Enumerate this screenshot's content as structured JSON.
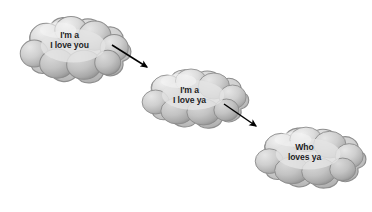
{
  "canvas": {
    "width": 372,
    "height": 212,
    "background": "#ffffff"
  },
  "palette": {
    "cloud_light": "#e9e9e9",
    "cloud_mid": "#c9c9c9",
    "cloud_shadow": "#a6a6a6",
    "cloud_edge": "#8f8f8f",
    "text": "#1d1d1f",
    "arrow": "#000000"
  },
  "diagram": {
    "type": "flow",
    "title": "",
    "nodes": [
      {
        "id": "cloud-1",
        "shape": "cloud",
        "line1": "I'm a",
        "line2": "I love you",
        "label_x": 69,
        "label_y": 33,
        "box": {
          "x": 17,
          "y": 11,
          "w": 105,
          "h": 76
        }
      },
      {
        "id": "cloud-2",
        "shape": "cloud",
        "line1": "I'm a",
        "line2": "I love ya",
        "label_x": 190,
        "label_y": 87,
        "box": {
          "x": 139,
          "y": 64,
          "w": 101,
          "h": 68
        }
      },
      {
        "id": "cloud-3",
        "shape": "cloud",
        "line1": "Who",
        "line2": "loves ya",
        "label_x": 306,
        "label_y": 144,
        "box": {
          "x": 252,
          "y": 122,
          "w": 105,
          "h": 70
        }
      }
    ],
    "arrows": [
      {
        "id": "arrow-1",
        "from": "cloud-1",
        "to": "cloud-2",
        "x1": 112,
        "y1": 45,
        "x2": 147,
        "y2": 67
      },
      {
        "id": "arrow-2",
        "from": "cloud-2",
        "to": "cloud-3",
        "x1": 224,
        "y1": 104,
        "x2": 256,
        "y2": 126
      }
    ]
  }
}
